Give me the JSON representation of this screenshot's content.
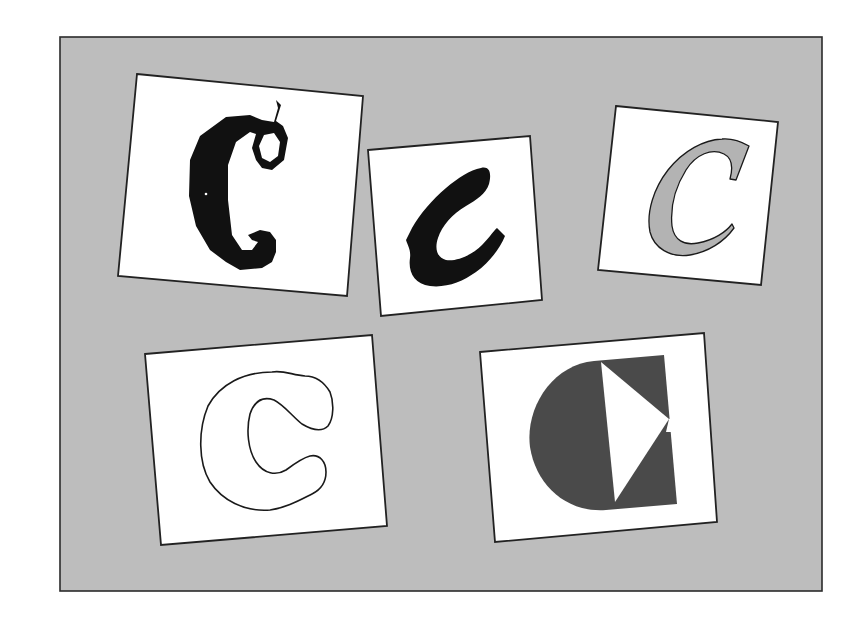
{
  "figure": {
    "colors": {
      "page_background": "#ffffff",
      "panel_background": "#bdbdbd",
      "panel_border": "#2b2b2b",
      "card_fill": "#ffffff",
      "card_border": "#222222",
      "glyph_black": "#111111",
      "glyph_grey_fill": "#b3b3b3",
      "glyph_dark_grey": "#4a4a4a",
      "glyph_outline": "#1a1a1a"
    },
    "cards": [
      {
        "id": "card-1",
        "letter": "C",
        "style": "blackletter / gothic capital C, solid black with curled terminals",
        "position": "top-left"
      },
      {
        "id": "card-2",
        "letter": "c",
        "style": "brush-script lowercase c, solid black",
        "position": "top-center"
      },
      {
        "id": "card-3",
        "letter": "C",
        "style": "italic serif capital C, grey fill with dark outline",
        "position": "top-right"
      },
      {
        "id": "card-4",
        "letter": "c",
        "style": "rounded bubble lowercase c, outline only",
        "position": "bottom-left"
      },
      {
        "id": "card-5",
        "letter": "C",
        "style": "geometric C: dark grey half-disc plus rectangle with white triangular notch",
        "position": "bottom-right"
      }
    ]
  }
}
